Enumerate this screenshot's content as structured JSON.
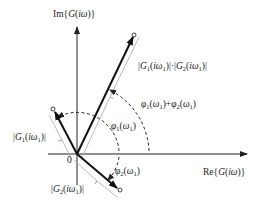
{
  "diagram": {
    "type": "complex-plane-phasor",
    "colors": {
      "vector": "#111111",
      "axis": "#222222",
      "arc": "#222222",
      "brace": "#aaaaaa",
      "text": "#222222"
    },
    "axes": {
      "imag_label": "Im{G(iω)}",
      "real_label": "Re{G(iω)}",
      "origin_label": "0"
    },
    "vectors": [
      {
        "id": "product",
        "magnitude_label": "|G1(iω1)|·|G2(iω1)|",
        "angle_label": "φ1(ω1)+φ2(ω1)"
      },
      {
        "id": "g1",
        "magnitude_label": "|G1(iω1)|",
        "angle_label": "φ1(ω1)"
      },
      {
        "id": "g2",
        "magnitude_label": "|G2(iω1)|",
        "angle_label": "φ2(ω1)"
      }
    ]
  }
}
